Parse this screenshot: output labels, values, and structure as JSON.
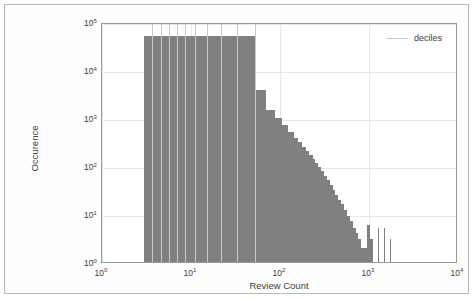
{
  "chart_data": {
    "type": "bar",
    "title": "",
    "xlabel": "Review Count",
    "ylabel": "Occurence",
    "xscale": "log",
    "yscale": "log",
    "xlim": [
      1,
      10000
    ],
    "ylim": [
      1,
      100000
    ],
    "grid": true,
    "legend_position": "top-right",
    "legend": [
      {
        "name": "deciles",
        "color": "#c9c9c9",
        "marker": "vline"
      }
    ],
    "xticks": [
      {
        "value": 1,
        "label": "10",
        "exponent": "0"
      },
      {
        "value": 10,
        "label": "10",
        "exponent": "1"
      },
      {
        "value": 100,
        "label": "10",
        "exponent": "2"
      },
      {
        "value": 1000,
        "label": "10",
        "exponent": "3"
      },
      {
        "value": 10000,
        "label": "10",
        "exponent": "4"
      }
    ],
    "yticks": [
      {
        "value": 1,
        "label": "10",
        "exponent": "0"
      },
      {
        "value": 10,
        "label": "10",
        "exponent": "1"
      },
      {
        "value": 100,
        "label": "10",
        "exponent": "2"
      },
      {
        "value": 1000,
        "label": "10",
        "exponent": "3"
      },
      {
        "value": 10000,
        "label": "10",
        "exponent": "4"
      },
      {
        "value": 100000,
        "label": "10",
        "exponent": "5"
      }
    ],
    "bar_color": "#808080",
    "bars": [
      {
        "x0": 3.0,
        "x1": 52.0,
        "y": 52000
      },
      {
        "x0": 52.0,
        "x1": 70.0,
        "y": 3800
      },
      {
        "x0": 70.0,
        "x1": 88.0,
        "y": 1450
      },
      {
        "x0": 88.0,
        "x1": 106.0,
        "y": 1000
      },
      {
        "x0": 106.0,
        "x1": 124.0,
        "y": 700
      },
      {
        "x0": 124.0,
        "x1": 142.0,
        "y": 510
      },
      {
        "x0": 142.0,
        "x1": 160.0,
        "y": 390
      },
      {
        "x0": 160.0,
        "x1": 178.0,
        "y": 310
      },
      {
        "x0": 178.0,
        "x1": 196.0,
        "y": 250
      },
      {
        "x0": 196.0,
        "x1": 214.0,
        "y": 205
      },
      {
        "x0": 214.0,
        "x1": 232.0,
        "y": 170
      },
      {
        "x0": 232.0,
        "x1": 250.0,
        "y": 140
      },
      {
        "x0": 250.0,
        "x1": 268.0,
        "y": 115
      },
      {
        "x0": 268.0,
        "x1": 290.0,
        "y": 95
      },
      {
        "x0": 290.0,
        "x1": 312.0,
        "y": 78
      },
      {
        "x0": 312.0,
        "x1": 336.0,
        "y": 62
      },
      {
        "x0": 336.0,
        "x1": 362.0,
        "y": 50
      },
      {
        "x0": 362.0,
        "x1": 390.0,
        "y": 40
      },
      {
        "x0": 390.0,
        "x1": 420.0,
        "y": 32
      },
      {
        "x0": 420.0,
        "x1": 452.0,
        "y": 25
      },
      {
        "x0": 452.0,
        "x1": 487.0,
        "y": 20
      },
      {
        "x0": 487.0,
        "x1": 524.0,
        "y": 16
      },
      {
        "x0": 524.0,
        "x1": 565.0,
        "y": 12
      },
      {
        "x0": 565.0,
        "x1": 608.0,
        "y": 9
      },
      {
        "x0": 608.0,
        "x1": 655.0,
        "y": 7
      },
      {
        "x0": 655.0,
        "x1": 706.0,
        "y": 5
      },
      {
        "x0": 706.0,
        "x1": 760.0,
        "y": 4
      },
      {
        "x0": 760.0,
        "x1": 818.0,
        "y": 3
      },
      {
        "x0": 818.0,
        "x1": 881.0,
        "y": 2
      },
      {
        "x0": 881.0,
        "x1": 949.0,
        "y": 2
      },
      {
        "x0": 949.0,
        "x1": 1022.0,
        "y": 6
      },
      {
        "x0": 1022.0,
        "x1": 1100.0,
        "y": 3
      },
      {
        "x0": 1100.0,
        "x1": 1185.0,
        "y": 1
      },
      {
        "x0": 1270.0,
        "x1": 1300.0,
        "y": 5
      },
      {
        "x0": 1480.0,
        "x1": 1515.0,
        "y": 5
      },
      {
        "x0": 1730.0,
        "x1": 1770.0,
        "y": 3
      }
    ],
    "deciles": [
      3.6,
      4.6,
      5.6,
      6.9,
      8.6,
      11.2,
      15.0,
      21.5,
      33.0,
      52.0
    ],
    "decile_top": 100000,
    "decile_color": "#c9c9c9"
  }
}
